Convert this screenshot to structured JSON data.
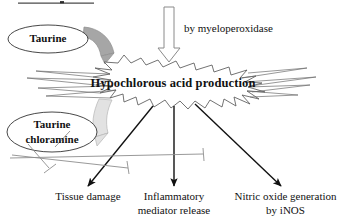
{
  "figure": {
    "type": "biological-pathway-diagram",
    "top_cropped_rule": "",
    "colors": {
      "stroke": "#111111",
      "burst_fill": "#ffffff",
      "burst_stroke": "#555555",
      "wedge_dark": "#a6a6a6",
      "wedge_light": "#e2e2e2",
      "inhibitor_line": "#8d8d8d",
      "hollow_arrow_fill": "#ffffff",
      "hollow_arrow_stroke": "#8a8a8a",
      "text": "#111111"
    },
    "nodes": {
      "taurine": {
        "label": "Taurine",
        "shape": "ellipse"
      },
      "taurine_chloramine": {
        "label": "Taurine\nchloramine",
        "line1": "Taurine",
        "line2": "chloramine",
        "shape": "ellipse"
      },
      "burst": {
        "label": "Hypochlorous acid production",
        "shape": "starburst"
      }
    },
    "annotations": {
      "enzyme": "by myeloperoxidase"
    },
    "outcomes": [
      {
        "id": "tissue-damage",
        "line1": "Tissue damage",
        "line2": ""
      },
      {
        "id": "inflammatory-mediator-release",
        "line1": "Inflammatory",
        "line2": "mediator release"
      },
      {
        "id": "nitric-oxide-generation",
        "line1": "Nitric oxide generation",
        "line2": "by iNOS"
      }
    ],
    "edges": [
      {
        "from": "myeloperoxidase-arrow",
        "to": "burst",
        "style": "hollow-block-arrow",
        "direction": "down"
      },
      {
        "from": "taurine",
        "to": "burst",
        "style": "dark-gray-curved-wedge"
      },
      {
        "from": "burst",
        "to": "taurine_chloramine",
        "style": "light-gray-curved-wedge"
      },
      {
        "from": "burst",
        "to": "tissue-damage",
        "style": "solid-arrow"
      },
      {
        "from": "burst",
        "to": "inflammatory-mediator-release",
        "style": "solid-arrow"
      },
      {
        "from": "burst",
        "to": "nitric-oxide-generation",
        "style": "solid-arrow"
      },
      {
        "from": "taurine_chloramine",
        "to": "tissue-damage",
        "style": "inhibition-t-bar"
      },
      {
        "from": "taurine_chloramine",
        "to": "inflammatory-mediator-release",
        "style": "inhibition-t-bar"
      },
      {
        "from": "taurine_chloramine",
        "to": "nitric-oxide-generation",
        "style": "inhibition-t-bar"
      }
    ]
  }
}
